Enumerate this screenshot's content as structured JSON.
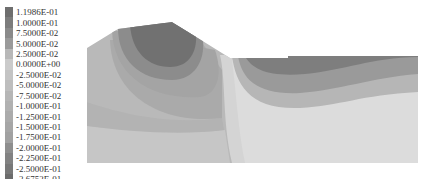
{
  "legend": {
    "entries": [
      {
        "label": "1.1986E-01",
        "color": "#6e6e6e"
      },
      {
        "label": "1.0000E-01",
        "color": "#7c7c7c"
      },
      {
        "label": "7.5000E-02",
        "color": "#8a8a8a"
      },
      {
        "label": "5.0000E-02",
        "color": "#9a9a9a"
      },
      {
        "label": "2.5000E-02",
        "color": "#b8b8b8"
      },
      {
        "label": "0.0000E+00",
        "color": "#cbcbcb"
      },
      {
        "label": "-2.5000E-02",
        "color": "#c4c4c4"
      },
      {
        "label": "-5.0000E-02",
        "color": "#bebebe"
      },
      {
        "label": "-7.5000E-02",
        "color": "#b6b6b6"
      },
      {
        "label": "-1.0000E-01",
        "color": "#b1b1b1"
      },
      {
        "label": "-1.2500E-01",
        "color": "#ababab"
      },
      {
        "label": "-1.5000E-01",
        "color": "#a6a6a6"
      },
      {
        "label": "-1.7500E-01",
        "color": "#a1a1a1"
      },
      {
        "label": "-2.0000E-01",
        "color": "#8e8e8e"
      },
      {
        "label": "-2.2500E-01",
        "color": "#828282"
      },
      {
        "label": "-2.5000E-01",
        "color": "#787878"
      },
      {
        "label": "-2.6752E-01",
        "color": "#6c6c6c"
      }
    ]
  },
  "plot": {
    "colors": {
      "bg_left": "#b9b9b9",
      "band1": "#b3b3b3",
      "band2": "#aaaaaa",
      "band3": "#a0a0a0",
      "core_outer": "#8c8c8c",
      "core_inner": "#707070",
      "light": "#d2d2d2",
      "lighter": "#dcdcdc",
      "right_dark": "#7e7e7e",
      "right_mid": "#9a9a9a",
      "right_light": "#b6b6b6"
    }
  }
}
